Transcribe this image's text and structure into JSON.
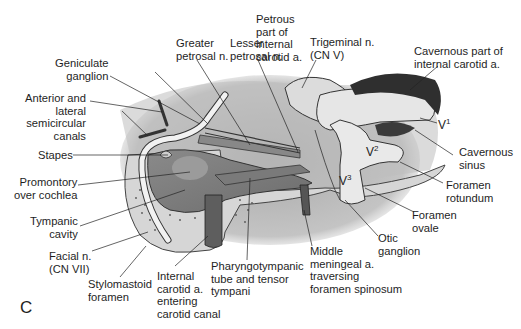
{
  "figure": {
    "panel_letter": "C",
    "colors": {
      "background": "#ffffff",
      "shadow": "#b8b8b8",
      "bone": "#d9d9d9",
      "nerve": "#eeeeee",
      "vessel": "#6a6a6a",
      "cavernous": "#3a3a3a",
      "text": "#1e1e1e"
    }
  },
  "labels": {
    "lesser_petrosal": "Lesser\npetrosal n.",
    "greater_petrosal": "Greater\npetrosal n.",
    "petrous_ica": "Petrous\npart of\ninternal\ncarotid a.",
    "trigeminal": "Trigeminal n.\n(CN V)",
    "cavernous_ica": "Cavernous part of\ninternal carotid a.",
    "geniculate": "Geniculate\nganglion",
    "semicircular": "Anterior and\nlateral\nsemicircular\ncanals",
    "stapes": "Stapes",
    "promontory": "Promontory\nover cochlea",
    "tympanic_cavity": "Tympanic\ncavity",
    "facial": "Facial n.\n(CN VII)",
    "stylomastoid": "Stylomastoid\nforamen",
    "ica_entering": "Internal\ncarotid a.\nentering\ncarotid canal",
    "pharyngotympanic": "Pharyngotympanic\ntube and tensor\ntympani",
    "middle_meningeal": "Middle\nmeningeal a.\ntraversing\nforamen spinosum",
    "otic_ganglion": "Otic\nganglion",
    "foramen_ovale": "Foramen\novale",
    "foramen_rotundum": "Foramen\nrotundum",
    "cavernous_sinus": "Cavernous\nsinus",
    "v1": "V",
    "v1_sup": "1",
    "v2": "V",
    "v2_sup": "2",
    "v3": "V",
    "v3_sup": "3"
  }
}
